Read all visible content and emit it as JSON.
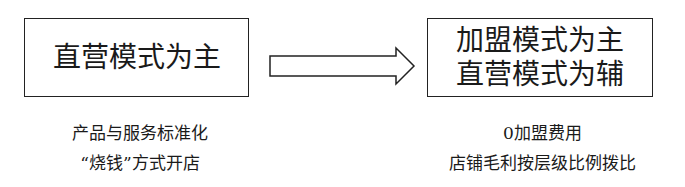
{
  "diagram": {
    "left": {
      "box_lines": [
        "直营模式为主"
      ],
      "caption_lines": [
        "产品与服务标准化",
        "“烧钱”方式开店"
      ]
    },
    "arrow": {
      "icon": "right-block-arrow",
      "direction": "left-to-right"
    },
    "right": {
      "box_lines": [
        "加盟模式为主",
        "直营模式为辅"
      ],
      "caption_lines": [
        "0加盟费用",
        "店铺毛利按层级比例拨比"
      ]
    }
  }
}
